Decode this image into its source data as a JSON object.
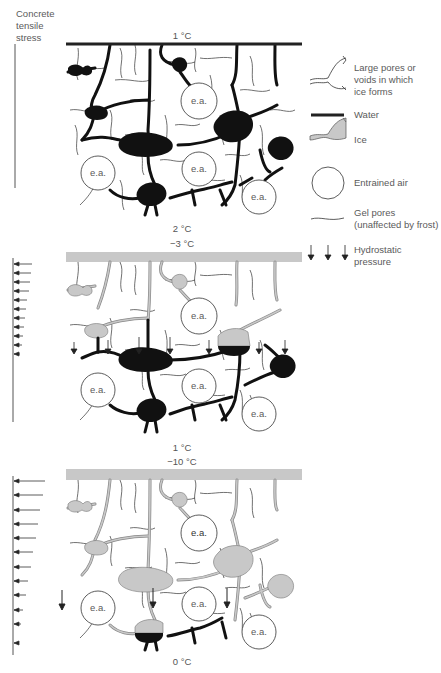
{
  "stress_axis": {
    "title_lines": [
      "Concrete",
      "tensile",
      "stress"
    ]
  },
  "panels": [
    {
      "top_temp": "1 °C",
      "bottom_temp": "2 °C",
      "surface": "water",
      "stress_arrows": 0
    },
    {
      "top_temp": "−3 °C",
      "bottom_temp": "1 °C",
      "surface": "ice",
      "stress_arrows": 11
    },
    {
      "top_temp": "−10 °C",
      "bottom_temp": "0 °C",
      "surface": "ice",
      "stress_arrows": 12
    }
  ],
  "air_label": "e.a.",
  "legend": {
    "large_pores": "Large pores or voids in which ice forms",
    "large_pores_lines": [
      "Large pores or",
      "voids in which",
      "ice forms"
    ],
    "water": "Water",
    "ice": "Ice",
    "entrained_air": "Entrained air",
    "gel_pores_lines": [
      "Gel pores",
      "(unaffected by frost)"
    ],
    "hydrostatic_lines": [
      "Hydrostatic",
      "pressure"
    ]
  },
  "colors": {
    "water": "#1a1a1a",
    "ice": "#c8c8c8",
    "ice_edge": "#8a8a8a",
    "gel": "#333333",
    "text": "#5a5a5a"
  }
}
